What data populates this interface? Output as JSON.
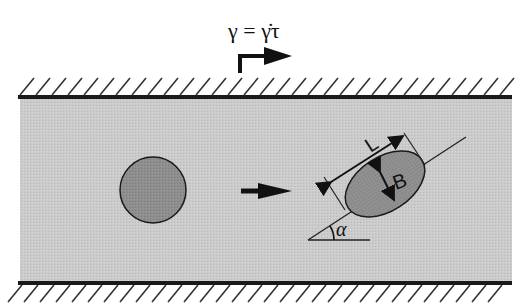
{
  "diagram": {
    "shear_equation": "γ = γ̇τ",
    "labels": {
      "length": "L",
      "breadth": "B",
      "angle": "α"
    },
    "colors": {
      "fluid": "#c8c8c8",
      "droplet": "#8c8c8c",
      "wall": "#1a1a1a",
      "background": "#ffffff"
    },
    "elements": {
      "top_wall": "moving wall with hatching",
      "bottom_wall": "fixed wall with hatching",
      "undeformed_droplet": "circle",
      "deformed_droplet": "ellipse tilted at angle α",
      "flow_arrow": "deformation direction arrow",
      "shear_arrow": "top wall velocity arrow"
    }
  }
}
